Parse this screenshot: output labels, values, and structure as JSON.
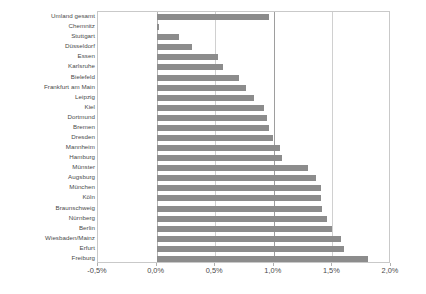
{
  "chart_data": {
    "type": "bar",
    "orientation": "horizontal",
    "title": "",
    "xlabel": "",
    "ylabel": "",
    "xlim": [
      -0.5,
      2.0
    ],
    "xticks": [
      "-0,5%",
      "0,0%",
      "0,5%",
      "1,0%",
      "1,5%",
      "2,0%"
    ],
    "xtick_values": [
      -0.5,
      0.0,
      0.5,
      1.0,
      1.5,
      2.0
    ],
    "grid": true,
    "legend": "none",
    "unit": "%",
    "bar_color": "#8c8c8c",
    "plot_border_color": "#c9c9c9",
    "gridline_color": "#d0d0d0",
    "categories": [
      "Umland gesamt",
      "Chemnitz",
      "Stuttgart",
      "Düsseldorf",
      "Essen",
      "Karlsruhe",
      "Bielefeld",
      "Frankfurt am Main",
      "Leipzig",
      "Kiel",
      "Dortmund",
      "Bremen",
      "Dresden",
      "Mannheim",
      "Hamburg",
      "Münster",
      "Augsburg",
      "München",
      "Köln",
      "Braunschweig",
      "Nürnberg",
      "Berlin",
      "Wiesbaden/Mainz",
      "Erfurt",
      "Freiburg"
    ],
    "values": [
      0.96,
      0.02,
      0.19,
      0.3,
      0.52,
      0.57,
      0.7,
      0.76,
      0.83,
      0.92,
      0.94,
      0.96,
      0.99,
      1.05,
      1.07,
      1.29,
      1.36,
      1.4,
      1.4,
      1.41,
      1.45,
      1.5,
      1.57,
      1.6,
      1.8
    ]
  }
}
